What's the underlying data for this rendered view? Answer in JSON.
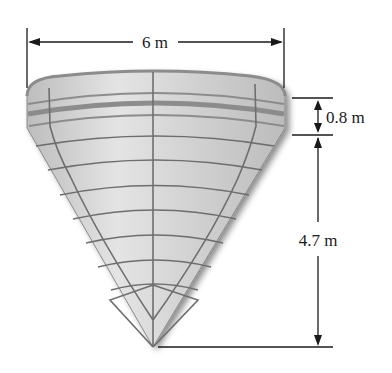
{
  "figure": {
    "type": "conical tank with cylindrical top band",
    "dimensions": {
      "diameter": {
        "label": "6 m",
        "value": 6,
        "unit": "m"
      },
      "cylinder_height": {
        "label": "0.8 m",
        "value": 0.8,
        "unit": "m"
      },
      "cone_height": {
        "label": "4.7 m",
        "value": 4.7,
        "unit": "m"
      }
    },
    "colors": {
      "surface": "#c8c8c8",
      "surface_light": "#e2e2e2",
      "grid_lines": "#6e6e6e",
      "band": "#8c8c8c",
      "dimension_lines": "#1a1a1a"
    }
  }
}
